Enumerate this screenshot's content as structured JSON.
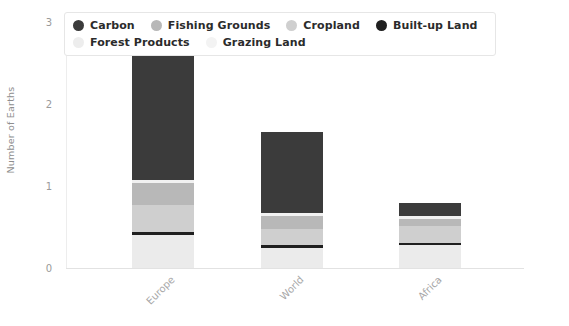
{
  "chart_data": {
    "type": "bar",
    "subtype": "stacked-bar",
    "title": "",
    "xlabel": "",
    "ylabel": "Number of Earths",
    "categories": [
      "Europe",
      "World",
      "Africa"
    ],
    "ylim": [
      0,
      3
    ],
    "yticks": [
      "0",
      "1",
      "2",
      "3"
    ],
    "grid": false,
    "legend_position": "top",
    "series": [
      {
        "name": "Grazing Land",
        "color": "#ebebeb",
        "values": [
          0.4,
          0.25,
          0.28
        ]
      },
      {
        "name": "Built-up Land",
        "color": "#1f1f1f",
        "values": [
          0.04,
          0.03,
          0.03
        ]
      },
      {
        "name": "Cropland",
        "color": "#cfcfcf",
        "values": [
          0.33,
          0.2,
          0.2
        ]
      },
      {
        "name": "Fishing Grounds",
        "color": "#b8b8b8",
        "values": [
          0.27,
          0.16,
          0.09
        ]
      },
      {
        "name": "Forest Products",
        "color": "#f1f1f1",
        "values": [
          0.04,
          0.03,
          0.03
        ]
      },
      {
        "name": "Carbon",
        "color": "#3b3b3b",
        "values": [
          1.58,
          0.99,
          0.16
        ]
      }
    ],
    "totals": [
      2.66,
      1.66,
      0.79
    ]
  },
  "legend": {
    "items": [
      {
        "label": "Carbon",
        "color": "#3b3b3b"
      },
      {
        "label": "Fishing Grounds",
        "color": "#b8b8b8"
      },
      {
        "label": "Cropland",
        "color": "#cfcfcf"
      },
      {
        "label": "Built-up Land",
        "color": "#1f1f1f"
      },
      {
        "label": "Forest Products",
        "color": "#ededed"
      },
      {
        "label": "Grazing Land",
        "color": "#f3f3f3"
      }
    ]
  }
}
